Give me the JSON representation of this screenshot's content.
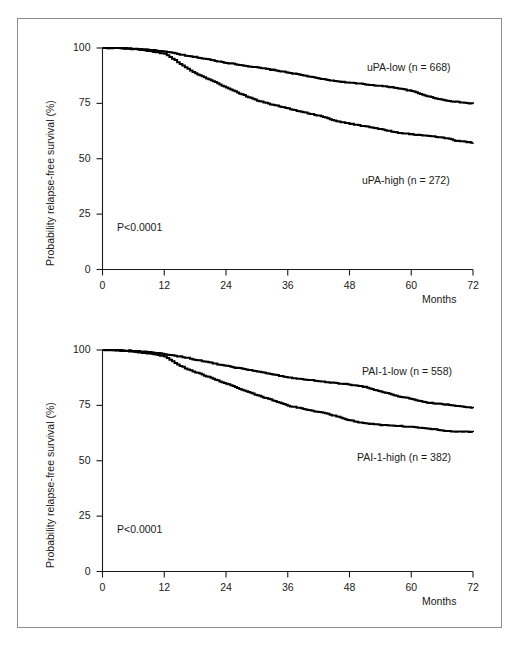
{
  "figure": {
    "panels": [
      {
        "id": "upa",
        "pvalue": "P<0.0001",
        "ylabel": "Probability relapse-free survival (%)",
        "xlabel": "Months",
        "labels": {
          "low": "uPA-low (n = 668)",
          "high": "uPA-high (n = 272)"
        }
      },
      {
        "id": "pai",
        "pvalue": "P<0.0001",
        "ylabel": "Probability relapse-free survival (%)",
        "xlabel": "Months",
        "labels": {
          "low": "PAI-1-low (n = 558)",
          "high": "PAI-1-high (n = 382)"
        }
      }
    ],
    "yticks": [
      "0",
      "25",
      "50",
      "75",
      "100"
    ],
    "xticks": [
      "0",
      "12",
      "24",
      "36",
      "48",
      "60",
      "72"
    ]
  },
  "chart_data": [
    {
      "type": "line",
      "title": "",
      "subtitle": "",
      "xlabel": "Months",
      "ylabel": "Probability relapse-free survival (%)",
      "xlim": [
        0,
        72
      ],
      "ylim": [
        0,
        100
      ],
      "xticks": [
        0,
        12,
        24,
        36,
        48,
        60,
        72
      ],
      "yticks": [
        0,
        25,
        50,
        75,
        100
      ],
      "grid": false,
      "legend_position": "inline-right",
      "annotations": [
        "P<0.0001"
      ],
      "plot_style": "kaplan-meier step",
      "series": [
        {
          "name": "uPA-low (n = 668)",
          "n": 668,
          "x": [
            0,
            3,
            6,
            9,
            12,
            14,
            16,
            18,
            21,
            24,
            27,
            30,
            33,
            36,
            39,
            42,
            45,
            48,
            51,
            54,
            57,
            60,
            63,
            66,
            69,
            72
          ],
          "values": [
            100,
            100,
            99.7,
            99.2,
            98.3,
            97.6,
            96.5,
            95.9,
            94.6,
            93.3,
            92.2,
            91.2,
            90.1,
            88.9,
            87.6,
            86.2,
            85.1,
            84.3,
            83.6,
            82.9,
            82.0,
            80.6,
            78.3,
            76.6,
            75.6,
            74.8
          ]
        },
        {
          "name": "uPA-high (n = 272)",
          "n": 272,
          "x": [
            0,
            3,
            6,
            9,
            12,
            14,
            16,
            18,
            21,
            24,
            27,
            30,
            33,
            36,
            39,
            42,
            45,
            48,
            51,
            54,
            57,
            60,
            63,
            66,
            69,
            72
          ],
          "values": [
            100,
            100,
            99.5,
            98.6,
            97.4,
            94.5,
            91.2,
            88.6,
            85.5,
            82.2,
            79.0,
            76.2,
            74.4,
            72.7,
            71.0,
            69.4,
            67.2,
            65.8,
            64.6,
            63.4,
            61.9,
            61.0,
            60.4,
            59.5,
            58.0,
            57.2
          ]
        }
      ]
    },
    {
      "type": "line",
      "title": "",
      "subtitle": "",
      "xlabel": "Months",
      "ylabel": "Probability relapse-free survival (%)",
      "xlim": [
        0,
        72
      ],
      "ylim": [
        0,
        100
      ],
      "xticks": [
        0,
        12,
        24,
        36,
        48,
        60,
        72
      ],
      "yticks": [
        0,
        25,
        50,
        75,
        100
      ],
      "grid": false,
      "legend_position": "inline-right",
      "annotations": [
        "P<0.0001"
      ],
      "plot_style": "kaplan-meier step",
      "series": [
        {
          "name": "PAI-1-low (n = 558)",
          "n": 558,
          "x": [
            0,
            3,
            6,
            9,
            12,
            14,
            16,
            18,
            21,
            24,
            27,
            30,
            33,
            36,
            39,
            42,
            45,
            48,
            51,
            54,
            57,
            60,
            63,
            66,
            69,
            72
          ],
          "values": [
            100,
            100,
            99.6,
            99.0,
            98.2,
            97.4,
            96.6,
            95.6,
            94.2,
            92.8,
            91.5,
            90.3,
            89.0,
            87.6,
            86.8,
            86.0,
            85.1,
            84.4,
            83.3,
            81.2,
            79.4,
            77.8,
            76.2,
            75.6,
            74.6,
            73.8
          ]
        },
        {
          "name": "PAI-1-high (n = 382)",
          "n": 382,
          "x": [
            0,
            3,
            6,
            9,
            12,
            14,
            16,
            18,
            21,
            24,
            27,
            30,
            33,
            36,
            39,
            42,
            45,
            48,
            51,
            54,
            57,
            60,
            63,
            66,
            69,
            72
          ],
          "values": [
            100,
            99.8,
            99.2,
            98.4,
            97.2,
            94.0,
            91.8,
            90.0,
            87.4,
            84.8,
            82.0,
            79.6,
            77.3,
            74.8,
            73.4,
            72.0,
            70.3,
            68.2,
            66.8,
            66.2,
            65.8,
            65.3,
            64.7,
            63.6,
            63.2,
            63.0
          ]
        }
      ]
    }
  ]
}
